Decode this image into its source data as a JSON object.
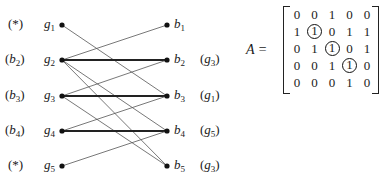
{
  "graph": {
    "left_nodes": [
      {
        "id": "g1",
        "name": "g",
        "sub": "1",
        "tag": "(*)",
        "tag_name": "",
        "tag_sub": "",
        "y": 25
      },
      {
        "id": "g2",
        "name": "g",
        "sub": "2",
        "tag": "",
        "tag_name": "b",
        "tag_sub": "2",
        "y": 60
      },
      {
        "id": "g3",
        "name": "g",
        "sub": "3",
        "tag": "",
        "tag_name": "b",
        "tag_sub": "3",
        "y": 96
      },
      {
        "id": "g4",
        "name": "g",
        "sub": "4",
        "tag": "",
        "tag_name": "b",
        "tag_sub": "4",
        "y": 131
      },
      {
        "id": "g5",
        "name": "g",
        "sub": "5",
        "tag": "(*)",
        "tag_name": "",
        "tag_sub": "",
        "y": 166
      }
    ],
    "right_nodes": [
      {
        "id": "b1",
        "name": "b",
        "sub": "1",
        "tag_name": "",
        "tag_sub": "",
        "y": 25
      },
      {
        "id": "b2",
        "name": "b",
        "sub": "2",
        "tag_name": "g",
        "tag_sub": "3",
        "y": 60
      },
      {
        "id": "b3",
        "name": "b",
        "sub": "3",
        "tag_name": "g",
        "tag_sub": "1",
        "y": 96
      },
      {
        "id": "b4",
        "name": "b",
        "sub": "4",
        "tag_name": "g",
        "tag_sub": "5",
        "y": 131
      },
      {
        "id": "b5",
        "name": "b",
        "sub": "5",
        "tag_name": "g",
        "tag_sub": "3",
        "y": 166
      }
    ],
    "edges": [
      {
        "from": "g1",
        "to": "b3",
        "bold": false
      },
      {
        "from": "g2",
        "to": "b1",
        "bold": false
      },
      {
        "from": "g2",
        "to": "b2",
        "bold": true
      },
      {
        "from": "g2",
        "to": "b4",
        "bold": false
      },
      {
        "from": "g2",
        "to": "b5",
        "bold": false
      },
      {
        "from": "g3",
        "to": "b2",
        "bold": false
      },
      {
        "from": "g3",
        "to": "b3",
        "bold": true
      },
      {
        "from": "g3",
        "to": "b5",
        "bold": false
      },
      {
        "from": "g4",
        "to": "b3",
        "bold": false
      },
      {
        "from": "g4",
        "to": "b4",
        "bold": true
      },
      {
        "from": "g5",
        "to": "b4",
        "bold": false
      }
    ]
  },
  "matrix": {
    "label": "A =",
    "rows": [
      [
        "0",
        "0",
        "1",
        "0",
        "0"
      ],
      [
        "1",
        "1",
        "0",
        "1",
        "1"
      ],
      [
        "0",
        "1",
        "1",
        "0",
        "1"
      ],
      [
        "0",
        "0",
        "1",
        "1",
        "0"
      ],
      [
        "0",
        "0",
        "0",
        "1",
        "0"
      ]
    ],
    "circled": [
      [
        1,
        1
      ],
      [
        2,
        2
      ],
      [
        3,
        3
      ]
    ]
  }
}
